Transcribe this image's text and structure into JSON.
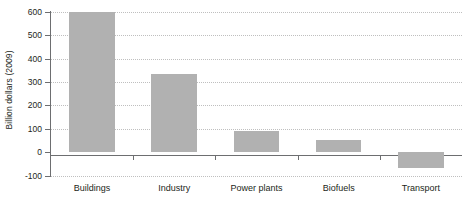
{
  "chart_data": {
    "type": "bar",
    "title": "",
    "subtitle": "",
    "xlabel": "",
    "ylabel": "Billion dollars (2009)",
    "categories": [
      "Buildings",
      "Industry",
      "Power plants",
      "Biofuels",
      "Transport"
    ],
    "values": [
      600,
      335,
      90,
      50,
      -70
    ],
    "series": [
      {
        "name": "Investment",
        "values": [
          600,
          335,
          90,
          50,
          -70
        ]
      }
    ],
    "ylim": [
      -100,
      600
    ],
    "yticks": [
      -100,
      0,
      100,
      200,
      300,
      400,
      500,
      600
    ],
    "ytick_labels": [
      "-100",
      "0",
      "100",
      "200",
      "300",
      "400",
      "500",
      "600"
    ],
    "grid": true,
    "grid_axis": "y",
    "grid_style": "dotted",
    "legend": false,
    "legend_position": "none",
    "bar_color": "#b1b1b1",
    "axis_color": "#6d6e70",
    "grid_color": "#bfbfbf",
    "text_color": "#231f20",
    "background": "#ffffff",
    "annotations": []
  },
  "axes": {
    "y_title": "Billion dollars (2009)"
  }
}
